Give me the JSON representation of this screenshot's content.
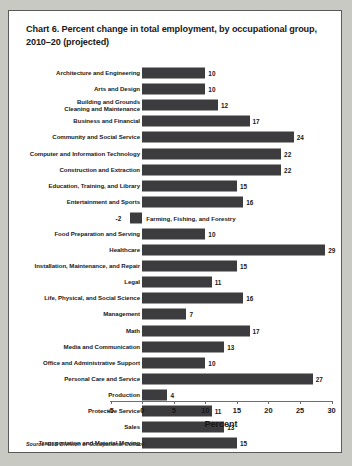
{
  "chart_card": {
    "title": "Chart 6. Percent change in total employment, by occupational group, 2010–20 (projected)",
    "source": "Source: BLS Division of Occupational Outlook",
    "bar_color": "#3c3c3e",
    "axis_color": "#6d6d6d",
    "text_color": "#18181a"
  },
  "chart_data": {
    "type": "bar",
    "orientation": "horizontal",
    "title": "Chart 6. Percent change in total employment, by occupational group, 2010–20 (projected)",
    "xlabel": "Percent",
    "ylabel": "",
    "xlim": [
      -5,
      30
    ],
    "xticks": [
      -5,
      0,
      5,
      10,
      15,
      20,
      25,
      30
    ],
    "xtick_labels": [
      "-5",
      "0",
      "5",
      "10",
      "15",
      "20",
      "25",
      "30"
    ],
    "grid": false,
    "legend": "none",
    "source": "Source: BLS Division of Occupational Outlook",
    "categories": [
      "Architecture and Engineering",
      "Arts and Design",
      "Building and Grounds\nCleaning and Maintenance",
      "Business and Financial",
      "Community and Social Service",
      "Computer and Information Technology",
      "Construction and Extraction",
      "Education, Training, and Library",
      "Entertainment and Sports",
      "Farming, Fishing, and Forestry",
      "Food Preparation and Serving",
      "Healthcare",
      "Installation, Maintenance, and Repair",
      "Legal",
      "Life, Physical, and Social Science",
      "Management",
      "Math",
      "Media and Communication",
      "Office and Administrative Support",
      "Personal Care and Service",
      "Production",
      "Protective Service",
      "Sales",
      "Transportation and Material Moving"
    ],
    "values": [
      10,
      10,
      12,
      17,
      24,
      22,
      22,
      15,
      16,
      -2,
      10,
      29,
      15,
      11,
      16,
      7,
      17,
      13,
      10,
      27,
      4,
      11,
      13,
      15
    ]
  },
  "rows": [
    {
      "label": "Architecture and Engineering",
      "value": 10,
      "value_text": "10",
      "label_inline": false
    },
    {
      "label": "Arts and Design",
      "value": 10,
      "value_text": "10",
      "label_inline": false
    },
    {
      "label": "Building and Grounds\nCleaning and Maintenance",
      "value": 12,
      "value_text": "12",
      "label_inline": false
    },
    {
      "label": "Business and Financial",
      "value": 17,
      "value_text": "17",
      "label_inline": false
    },
    {
      "label": "Community and Social Service",
      "value": 24,
      "value_text": "24",
      "label_inline": false
    },
    {
      "label": "Computer and Information Technology",
      "value": 22,
      "value_text": "22",
      "label_inline": false
    },
    {
      "label": "Construction and Extraction",
      "value": 22,
      "value_text": "22",
      "label_inline": false
    },
    {
      "label": "Education, Training, and Library",
      "value": 15,
      "value_text": "15",
      "label_inline": false
    },
    {
      "label": "Entertainment and Sports",
      "value": 16,
      "value_text": "16",
      "label_inline": false
    },
    {
      "label": "Farming, Fishing, and Forestry",
      "value": -2,
      "value_text": "-2",
      "label_inline": true
    },
    {
      "label": "Food Preparation and Serving",
      "value": 10,
      "value_text": "10",
      "label_inline": false
    },
    {
      "label": "Healthcare",
      "value": 29,
      "value_text": "29",
      "label_inline": false
    },
    {
      "label": "Installation, Maintenance, and Repair",
      "value": 15,
      "value_text": "15",
      "label_inline": false
    },
    {
      "label": "Legal",
      "value": 11,
      "value_text": "11",
      "label_inline": false
    },
    {
      "label": "Life, Physical, and Social Science",
      "value": 16,
      "value_text": "16",
      "label_inline": false
    },
    {
      "label": "Management",
      "value": 7,
      "value_text": "7",
      "label_inline": false
    },
    {
      "label": "Math",
      "value": 17,
      "value_text": "17",
      "label_inline": false
    },
    {
      "label": "Media and Communication",
      "value": 13,
      "value_text": "13",
      "label_inline": false
    },
    {
      "label": "Office and Administrative Support",
      "value": 10,
      "value_text": "10",
      "label_inline": false
    },
    {
      "label": "Personal Care and Service",
      "value": 27,
      "value_text": "27",
      "label_inline": false
    },
    {
      "label": "Production",
      "value": 4,
      "value_text": "4",
      "label_inline": false
    },
    {
      "label": "Protective Service",
      "value": 11,
      "value_text": "11",
      "label_inline": false
    },
    {
      "label": "Sales",
      "value": 13,
      "value_text": "13",
      "label_inline": false
    },
    {
      "label": "Transportation and Material Moving",
      "value": 15,
      "value_text": "15",
      "label_inline": false
    }
  ]
}
